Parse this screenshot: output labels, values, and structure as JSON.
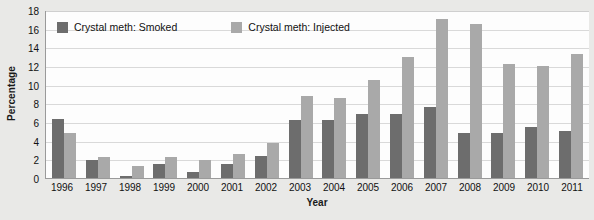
{
  "chart_data": {
    "type": "bar",
    "title": "",
    "xlabel": "Year",
    "ylabel": "Percentage",
    "ylim": [
      0,
      18
    ],
    "ytick_step": 2,
    "yticks": [
      0,
      2,
      4,
      6,
      8,
      10,
      12,
      14,
      16,
      18
    ],
    "grid": true,
    "legend_position": "top-inside",
    "categories": [
      "1996",
      "1997",
      "1998",
      "1999",
      "2000",
      "2001",
      "2002",
      "2003",
      "2004",
      "2005",
      "2006",
      "2007",
      "2008",
      "2009",
      "2010",
      "2011"
    ],
    "series": [
      {
        "name": "Crystal meth: Smoked",
        "color": "#6d6d6d",
        "values": [
          6.3,
          1.9,
          0.2,
          1.5,
          0.6,
          1.5,
          2.4,
          6.2,
          6.2,
          6.9,
          6.9,
          7.6,
          4.8,
          4.8,
          5.5,
          5.0
        ]
      },
      {
        "name": "Crystal meth: Injected",
        "color": "#a9a9a9",
        "values": [
          4.8,
          2.3,
          1.3,
          2.2,
          1.9,
          2.6,
          3.7,
          8.8,
          8.6,
          10.5,
          13.0,
          17.0,
          16.5,
          12.2,
          12.0,
          13.3
        ]
      }
    ]
  },
  "axis": {
    "y_title": "Percentage",
    "x_title": "Year"
  }
}
